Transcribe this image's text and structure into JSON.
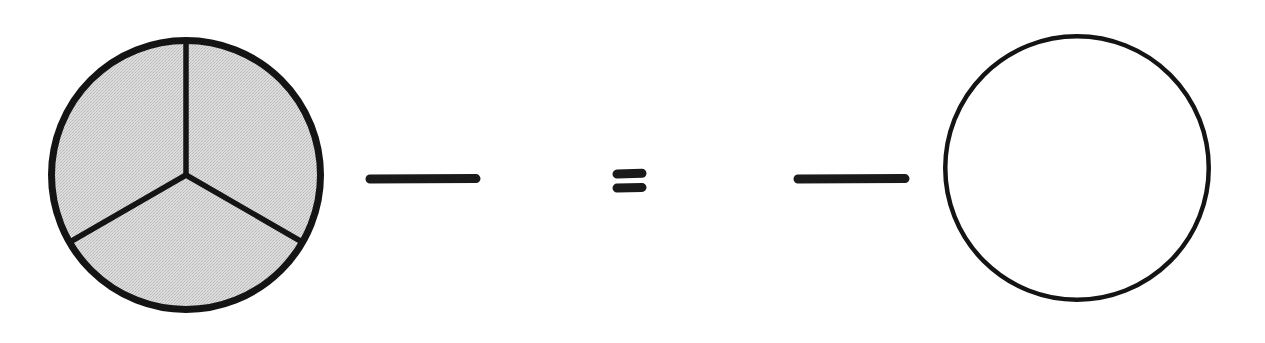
{
  "canvas": {
    "width": 1265,
    "height": 343,
    "background": "#ffffff"
  },
  "palette": {
    "ink": "#1a1a1a",
    "stroke": "#141414",
    "shaded_fill": "#d4d4d4",
    "empty_fill": "#ffffff"
  },
  "chart_data": {
    "type": "pie",
    "title": "",
    "subtitle": "",
    "xlabel": "",
    "ylabel": "",
    "grid": false,
    "legend_position": "none",
    "expression": "whole minus whole equals empty",
    "charts": [
      {
        "name": "left-pie",
        "role": "minuend",
        "label": "",
        "center_x": 186,
        "center_y": 175,
        "radius": 138,
        "stroke_width": 7,
        "start_angle_deg": -90,
        "slice_count": 3,
        "labels": [
          "slice-1",
          "slice-2",
          "slice-3"
        ],
        "values": [
          1,
          1,
          1
        ],
        "fractions": [
          "1/3",
          "1/3",
          "1/3"
        ],
        "shaded": [
          true,
          true,
          true
        ],
        "shaded_count": 3,
        "total_value": 3,
        "fill": "#d4d4d4",
        "divider_angles_deg": [
          -90,
          30,
          150
        ]
      },
      {
        "name": "right-pie",
        "role": "result",
        "label": "",
        "center_x": 1077,
        "center_y": 168,
        "radius": 134,
        "stroke_width": 4.5,
        "start_angle_deg": -90,
        "slice_count": 0,
        "labels": [],
        "values": [],
        "fractions": [],
        "shaded": [],
        "shaded_count": 0,
        "total_value": 0,
        "fill": "#ffffff",
        "divider_angles_deg": []
      }
    ],
    "operators": [
      {
        "name": "minus-operator-1",
        "glyph": "−",
        "symbol": "minus",
        "x1": 367,
        "x2": 479,
        "y": 179,
        "thickness": 9
      },
      {
        "name": "equals-operator",
        "glyph": "=",
        "symbol": "equals",
        "x1": 613,
        "x2": 646,
        "y_top": 174,
        "y_bottom": 188,
        "thickness": 9
      },
      {
        "name": "minus-operator-2",
        "glyph": "−",
        "symbol": "minus",
        "x1": 795,
        "x2": 908,
        "y": 179,
        "thickness": 9
      }
    ]
  },
  "accessibility": {
    "figure_description": "A circle divided into three equal shaded thirds, a minus sign, an equals sign, another minus sign, and an empty unshaded circle."
  }
}
